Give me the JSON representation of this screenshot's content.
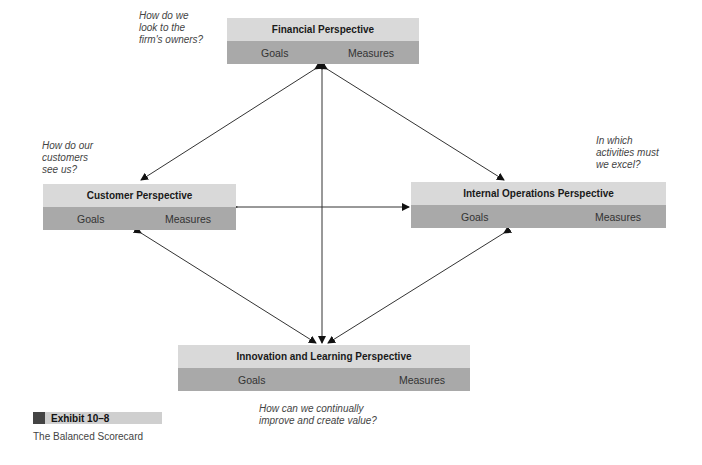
{
  "diagram": {
    "perspectives": [
      {
        "id": "financial",
        "title": "Financial Perspective",
        "goals": "Goals",
        "measures": "Measures",
        "question": [
          "How do we",
          "look to the",
          "firm's owners?"
        ]
      },
      {
        "id": "customer",
        "title": "Customer Perspective",
        "goals": "Goals",
        "measures": "Measures",
        "question": [
          "How do our",
          "customers",
          "see us?"
        ]
      },
      {
        "id": "internal",
        "title": "Internal Operations Perspective",
        "goals": "Goals",
        "measures": "Measures",
        "question": [
          "In which",
          "activities must",
          "we excel?"
        ]
      },
      {
        "id": "innovation",
        "title": "Innovation and Learning Perspective",
        "goals": "Goals",
        "measures": "Measures",
        "question": [
          "How can we continually",
          "improve and create value?"
        ]
      }
    ],
    "connections": [
      {
        "from": "financial",
        "to": "customer",
        "bidirectional": true
      },
      {
        "from": "financial",
        "to": "internal",
        "bidirectional": true
      },
      {
        "from": "financial",
        "to": "innovation",
        "bidirectional": true
      },
      {
        "from": "customer",
        "to": "internal",
        "bidirectional": true
      },
      {
        "from": "customer",
        "to": "innovation",
        "bidirectional": true
      },
      {
        "from": "internal",
        "to": "innovation",
        "bidirectional": true
      }
    ]
  },
  "exhibit": {
    "label": "Exhibit 10–8",
    "caption": "The Balanced Scorecard"
  }
}
